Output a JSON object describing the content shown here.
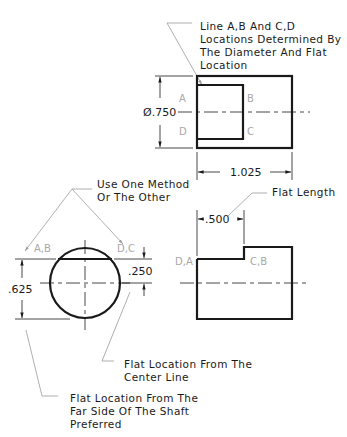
{
  "notes": {
    "top_note": [
      "Line A,B And C,D",
      "Locations Determined By",
      "The Diameter And Flat",
      "Location"
    ],
    "method_note": [
      "Use One Method",
      "Or The Other"
    ],
    "flat_length_note": "Flat Length",
    "center_line_note": [
      "Flat Location From The",
      "Center Line"
    ],
    "far_side_note": [
      "Flat Location From The",
      "Far Side Of The Shaft",
      "Preferred"
    ]
  },
  "dimensions": {
    "diameter": "Ø.750",
    "length": "1.025",
    "flat_length": ".500",
    "flat_from_far_side": ".625",
    "flat_from_center": ".250"
  },
  "point_labels": {
    "top_a": "A",
    "top_b": "B",
    "top_c": "C",
    "top_d": "D",
    "end_ab": "A,B",
    "end_dc": "D,C",
    "side_da": "D,A",
    "side_cb": "C,B"
  }
}
